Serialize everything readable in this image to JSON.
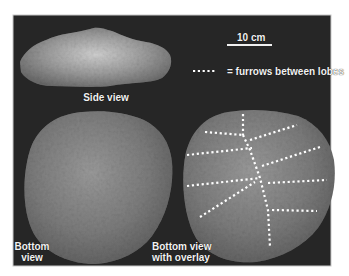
{
  "figure": {
    "background_color": "#262626",
    "frame_color": "#bfbfbf",
    "specimen_color": "#8a8a8a",
    "furrow_dot_color": "#ffffff"
  },
  "scale_bar": {
    "label": "10 cm"
  },
  "legend": {
    "symbol": "•••••",
    "text": "= furrows between lobes"
  },
  "panels": [
    {
      "id": "side",
      "label_lines": [
        "Side view"
      ]
    },
    {
      "id": "bottom",
      "label_lines": [
        "Bottom",
        "view"
      ]
    },
    {
      "id": "bottom-overlay",
      "label_lines": [
        "Bottom view",
        "with overlay"
      ]
    }
  ]
}
